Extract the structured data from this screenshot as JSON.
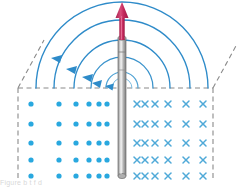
{
  "figure": {
    "caption_fragment": "Figure  b  t      f    d    ",
    "colors": {
      "field_line": "#2E8BC9",
      "field_line_light": "#5BA8D8",
      "dot_marker": "#29A8DF",
      "cross_marker": "#4FA9D8",
      "current_arrow": "#C62A5E",
      "wire_body": "#9B9B9B",
      "wire_highlight": "#D8D8D8",
      "plane_edge": "#8A8A8A",
      "background": "#FFFFFF"
    }
  },
  "wire": {
    "label": "current-carrying-wire",
    "x": 122,
    "top_y": 38,
    "bottom_y": 178,
    "width": 8
  },
  "current_arrow": {
    "label": "current-direction-arrow",
    "symbol": "I",
    "direction": "up",
    "x": 122,
    "tail_y": 40,
    "tip_y": 3,
    "head_width": 11,
    "head_height": 14
  },
  "plane": {
    "label": "horizontal-plane",
    "front_edge_y": 88,
    "left_x": 18,
    "right_x": 213,
    "left_diagonal": {
      "x1": 18,
      "y1": 88,
      "x2": 44,
      "y2": 40
    },
    "right_diagonal": {
      "x1": 213,
      "y1": 88,
      "x2": 237,
      "y2": 44
    },
    "left_vertical": {
      "x": 18,
      "y1": 88,
      "y2": 180
    },
    "right_vertical": {
      "x": 213,
      "y1": 88,
      "y2": 180
    }
  },
  "field_lines": {
    "label": "magnetic-field-lines",
    "circulation": "counterclockwise",
    "center_x": 122,
    "center_y": 88,
    "radii": [
      16,
      31,
      48,
      68,
      86
    ],
    "arrow_positions_deg": [
      155,
      150,
      143,
      150,
      160
    ]
  },
  "field_out_of_page": {
    "label": "field-out-of-page-dots",
    "symbol": "dot",
    "meaning": "B out of page",
    "rows": 5,
    "cols": 6,
    "row_y": [
      104,
      124,
      143,
      160,
      176
    ],
    "col_x": [
      31,
      59,
      76,
      89,
      99,
      107
    ]
  },
  "field_into_page": {
    "label": "field-into-page-crosses",
    "symbol": "×",
    "meaning": "B into page",
    "rows": 5,
    "cols": 6,
    "row_y": [
      104,
      124,
      143,
      160,
      176
    ],
    "col_x": [
      137,
      145,
      155,
      168,
      186,
      203
    ]
  }
}
